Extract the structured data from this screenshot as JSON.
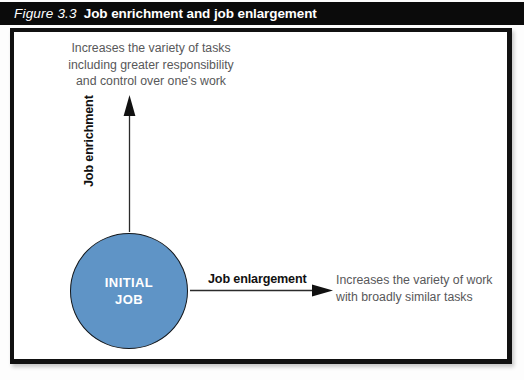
{
  "figure": {
    "number": "Figure 3.3",
    "title": "Job enrichment and job enlargement"
  },
  "diagram": {
    "center_node": {
      "label": "INITIAL\nJOB",
      "shape": "circle",
      "fill_color": "#5f94c6",
      "text_color": "#ffffff",
      "border_color": "#14181c"
    },
    "vertical_axis": {
      "arrow_label": "Job enrichment",
      "arrow_direction": "up",
      "description": "Increases the variety of tasks\nincluding greater responsibility\nand control over one's work"
    },
    "horizontal_axis": {
      "arrow_label": "Job enlargement",
      "arrow_direction": "right",
      "description": "Increases the variety of work\nwith broadly similar tasks"
    },
    "colors": {
      "title_bar_background": "#0b0b0b",
      "title_bar_text": "#ffffff",
      "body_text": "#58585a",
      "label_text": "#111111",
      "frame_border": "#111111",
      "canvas_background": "#ffffff"
    }
  }
}
